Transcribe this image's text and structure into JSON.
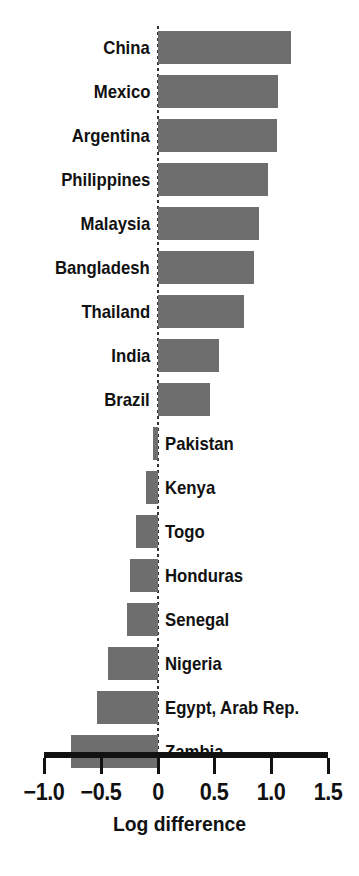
{
  "chart_data": {
    "type": "bar",
    "orientation": "horizontal",
    "title": "",
    "xlabel": "Log difference",
    "ylabel": "",
    "xlim": [
      -1.0,
      1.5
    ],
    "xticks": [
      -1.0,
      -0.5,
      0,
      0.5,
      1.0,
      1.5
    ],
    "xtick_labels": [
      "−1.0",
      "−0.5",
      "0",
      "0.5",
      "1.0",
      "1.5"
    ],
    "grid": false,
    "legend": null,
    "zero_reference_line": true,
    "bar_color": "#6e6e6e",
    "axis_color": "#111111",
    "categories": [
      "China",
      "Mexico",
      "Argentina",
      "Philippines",
      "Malaysia",
      "Bangladesh",
      "Thailand",
      "India",
      "Brazil",
      "Pakistan",
      "Kenya",
      "Togo",
      "Honduras",
      "Senegal",
      "Nigeria",
      "Egypt, Arab Rep.",
      "Zambia"
    ],
    "values": [
      1.17,
      1.06,
      1.05,
      0.97,
      0.89,
      0.85,
      0.76,
      0.54,
      0.46,
      -0.04,
      -0.1,
      -0.19,
      -0.24,
      -0.27,
      -0.44,
      -0.53,
      -0.76
    ],
    "label_side": [
      "left",
      "left",
      "left",
      "left",
      "left",
      "left",
      "left",
      "left",
      "left",
      "right",
      "right",
      "right",
      "right",
      "right",
      "right",
      "right",
      "right"
    ]
  }
}
